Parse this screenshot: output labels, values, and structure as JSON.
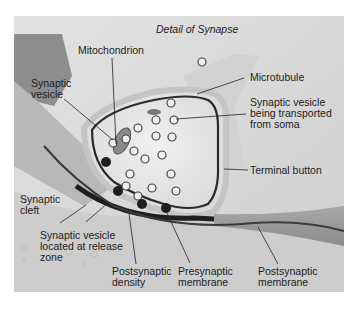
{
  "diagram": {
    "title": "Detail of Synapse",
    "labels": {
      "mitochondrion": "Mitochondrion",
      "synaptic_vesicle": "Synaptic\nvesicle",
      "microtubule": "Microtubule",
      "vesicle_transported": "Synaptic vesicle\nbeing transported\nfrom soma",
      "terminal_button": "Terminal button",
      "synaptic_cleft": "Synaptic\ncleft",
      "vesicle_release_zone": "Synaptic vesicle\nlocated at release\nzone",
      "postsynaptic_density": "Postsynaptic\ndensity",
      "presynaptic_membrane": "Presynaptic\nmembrane",
      "postsynaptic_membrane": "Postsynaptic\nmembrane"
    },
    "colors": {
      "background": "#d9d9d9",
      "terminal_fill": "#ececec",
      "axon_fill": "#bdbdbd",
      "membrane_dark": "#2a2a2a",
      "postsynaptic": "#9a9a9a"
    }
  }
}
